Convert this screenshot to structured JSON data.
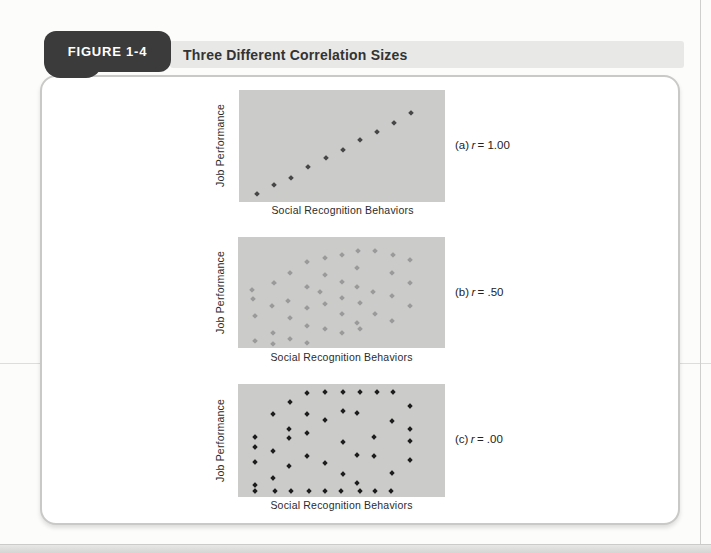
{
  "figure": {
    "tab_label": "FIGURE 1-4",
    "title": "Three Different Correlation Sizes"
  },
  "colors": {
    "page_bg": "#fcfcfb",
    "tab_bg": "#3b3b3b",
    "tab_text": "#ffffff",
    "title_bar_bg": "#e8e8e6",
    "title_text": "#333333",
    "panel_bg": "#ffffff",
    "panel_border": "#c9c9c7",
    "plot_bg": "#cbcbca",
    "axis_text": "#2b2b2b"
  },
  "chart_data": [
    {
      "type": "scatter",
      "panel_id": "a",
      "caption_label": "(a) r = 1.00",
      "caption_prefix": "(a)",
      "caption_var": "r",
      "caption_value": "= 1.00",
      "correlation_r": 1.0,
      "xlabel": "Social Recognition Behaviors",
      "ylabel": "Job Performance",
      "x_range_pct": [
        0,
        100
      ],
      "y_range_pct": [
        0,
        100
      ],
      "grid": false,
      "axis_ticks": false,
      "n_points": 10,
      "point_color": "#474747",
      "point_size_px": 3.5,
      "points_pct": [
        [
          8.7,
          8.0
        ],
        [
          17.0,
          15.2
        ],
        [
          25.2,
          22.3
        ],
        [
          33.5,
          31.3
        ],
        [
          42.2,
          39.3
        ],
        [
          50.5,
          47.3
        ],
        [
          58.7,
          55.4
        ],
        [
          67.0,
          63.4
        ],
        [
          75.2,
          71.4
        ],
        [
          83.5,
          79.5
        ]
      ]
    },
    {
      "type": "scatter",
      "panel_id": "b",
      "caption_label": "(b) r = .50",
      "caption_prefix": "(b)",
      "caption_var": "r",
      "caption_value": "= .50",
      "correlation_r": 0.5,
      "xlabel": "Social Recognition Behaviors",
      "ylabel": "Job Performance",
      "x_range_pct": [
        0,
        100
      ],
      "y_range_pct": [
        0,
        100
      ],
      "grid": false,
      "axis_ticks": false,
      "n_points": 43,
      "point_color": "#9a9a9a",
      "point_size_px": 3.5,
      "points_pct": [
        [
          50.2,
          83.8
        ],
        [
          58.0,
          88.3
        ],
        [
          66.2,
          88.3
        ],
        [
          74.9,
          83.8
        ],
        [
          33.3,
          77.5
        ],
        [
          42.0,
          81.1
        ],
        [
          83.1,
          79.3
        ],
        [
          25.1,
          67.6
        ],
        [
          57.5,
          72.1
        ],
        [
          74.4,
          67.6
        ],
        [
          17.4,
          58.6
        ],
        [
          42.0,
          65.8
        ],
        [
          50.2,
          59.5
        ],
        [
          83.1,
          58.6
        ],
        [
          6.8,
          52.3
        ],
        [
          33.3,
          55.0
        ],
        [
          57.5,
          55.0
        ],
        [
          65.2,
          50.5
        ],
        [
          74.4,
          47.7
        ],
        [
          39.6,
          50.5
        ],
        [
          7.2,
          45.0
        ],
        [
          24.2,
          43.2
        ],
        [
          50.2,
          45.9
        ],
        [
          58.9,
          41.4
        ],
        [
          83.1,
          38.7
        ],
        [
          16.4,
          38.7
        ],
        [
          33.3,
          36.9
        ],
        [
          42.0,
          40.5
        ],
        [
          66.2,
          31.5
        ],
        [
          74.4,
          25.2
        ],
        [
          8.2,
          29.7
        ],
        [
          25.1,
          27.9
        ],
        [
          50.2,
          31.5
        ],
        [
          57.5,
          23.4
        ],
        [
          16.9,
          14.4
        ],
        [
          33.3,
          20.7
        ],
        [
          42.0,
          18.0
        ],
        [
          50.2,
          14.4
        ],
        [
          58.9,
          18.0
        ],
        [
          8.2,
          7.2
        ],
        [
          16.9,
          4.5
        ],
        [
          25.1,
          9.0
        ],
        [
          33.3,
          5.4
        ]
      ]
    },
    {
      "type": "scatter",
      "panel_id": "c",
      "caption_label": "(c) r = .00",
      "caption_prefix": "(c)",
      "caption_var": "r",
      "caption_value": "= .00",
      "correlation_r": 0.0,
      "xlabel": "Social Recognition Behaviors",
      "ylabel": "Job Performance",
      "x_range_pct": [
        0,
        100
      ],
      "y_range_pct": [
        0,
        100
      ],
      "grid": false,
      "axis_ticks": false,
      "n_points": 45,
      "point_color": "#1d1d1d",
      "point_size_px": 4,
      "points_pct": [
        [
          33.3,
          92.0
        ],
        [
          42.0,
          92.9
        ],
        [
          50.7,
          92.9
        ],
        [
          58.9,
          92.9
        ],
        [
          67.1,
          92.9
        ],
        [
          74.9,
          92.9
        ],
        [
          25.1,
          84.1
        ],
        [
          83.1,
          80.5
        ],
        [
          16.9,
          73.5
        ],
        [
          33.3,
          73.5
        ],
        [
          50.7,
          76.1
        ],
        [
          57.5,
          74.3
        ],
        [
          42.0,
          68.1
        ],
        [
          74.4,
          67.3
        ],
        [
          83.1,
          60.2
        ],
        [
          24.6,
          60.2
        ],
        [
          33.3,
          56.6
        ],
        [
          8.2,
          53.1
        ],
        [
          65.7,
          53.1
        ],
        [
          83.1,
          49.6
        ],
        [
          8.2,
          44.2
        ],
        [
          24.6,
          52.2
        ],
        [
          50.7,
          48.7
        ],
        [
          16.9,
          40.7
        ],
        [
          33.3,
          36.3
        ],
        [
          57.5,
          37.2
        ],
        [
          65.7,
          36.3
        ],
        [
          83.1,
          32.7
        ],
        [
          8.2,
          31.0
        ],
        [
          24.6,
          27.4
        ],
        [
          42.0,
          30.1
        ],
        [
          50.7,
          20.4
        ],
        [
          74.4,
          21.2
        ],
        [
          16.9,
          16.8
        ],
        [
          57.5,
          12.4
        ],
        [
          8.2,
          10.6
        ],
        [
          8.2,
          5.3
        ],
        [
          17.9,
          5.3
        ],
        [
          25.6,
          5.3
        ],
        [
          34.3,
          5.3
        ],
        [
          42.0,
          5.3
        ],
        [
          49.8,
          5.3
        ],
        [
          58.9,
          5.3
        ],
        [
          66.2,
          5.3
        ],
        [
          73.9,
          5.3
        ]
      ]
    }
  ]
}
